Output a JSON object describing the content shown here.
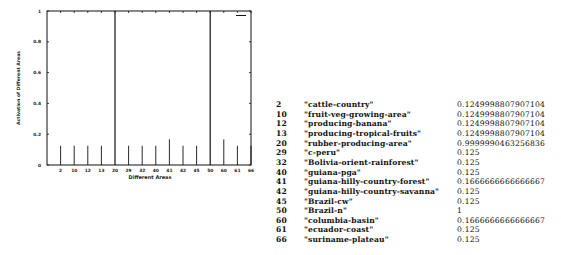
{
  "chart_data": {
    "type": "bar",
    "title": "",
    "xlabel": "Different Areas",
    "ylabel": "Activation of Different Areas",
    "ylim": [
      0,
      1
    ],
    "yticks": [
      "0",
      "0.2",
      "0.4",
      "0.6",
      "0.8",
      "1"
    ],
    "grid": false,
    "legend": {
      "position": "top-right",
      "entries": [
        ""
      ]
    },
    "categories": [
      "2",
      "10",
      "12",
      "13",
      "20",
      "29",
      "32",
      "40",
      "41",
      "42",
      "45",
      "50",
      "60",
      "61",
      "66"
    ],
    "values": [
      0.1249998807907104,
      0.1249998807907104,
      0.1249998807907104,
      0.1249998807907104,
      0.9999990463256836,
      0.125,
      0.125,
      0.125,
      0.1666666666666667,
      0.125,
      0.125,
      1,
      0.1666666666666667,
      0.125,
      0.125
    ]
  },
  "table": {
    "rows": [
      {
        "id": "2",
        "name": "\"cattle-country\"",
        "value": "0.1249998807907104"
      },
      {
        "id": "10",
        "name": "\"fruit-veg-growing-area\"",
        "value": "0.1249998807907104"
      },
      {
        "id": "12",
        "name": "\"producing-banana\"",
        "value": "0.1249998807907104"
      },
      {
        "id": "13",
        "name": "\"producing-tropical-fruits\"",
        "value": "0.1249998807907104"
      },
      {
        "id": "20",
        "name": "\"rubber-producing-area\"",
        "value": "0.9999990463256836"
      },
      {
        "id": "29",
        "name": "\"c-peru\"",
        "value": "0.125"
      },
      {
        "id": "32",
        "name": "\"Bolivia-orient-rainforest\"",
        "value": "0.125"
      },
      {
        "id": "40",
        "name": "\"guiana-pga\"",
        "value": "0.125"
      },
      {
        "id": "41",
        "name": "\"guiana-hilly-country-forest\"",
        "value": "0.1666666666666667"
      },
      {
        "id": "42",
        "name": "\"guiana-hilly-country-savanna\"",
        "value": "0.125"
      },
      {
        "id": "45",
        "name": "\"Brazil-cw\"",
        "value": "0.125"
      },
      {
        "id": "50",
        "name": "\"Brazil-n\"",
        "value": "1"
      },
      {
        "id": "60",
        "name": "\"columbia-basin\"",
        "value": "0.1666666666666667"
      },
      {
        "id": "61",
        "name": "\"ecuador-coast\"",
        "value": "0.125"
      },
      {
        "id": "66",
        "name": "\"suriname-plateau\"",
        "value": "0.125"
      }
    ]
  },
  "colors": {
    "ink": "#111111",
    "background": "#ffffff"
  }
}
